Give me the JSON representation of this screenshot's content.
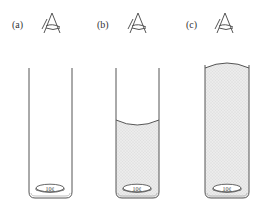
{
  "figure": {
    "panels": [
      {
        "id": "a",
        "label": "(a)",
        "coin_label": "10¢",
        "water": "none"
      },
      {
        "id": "b",
        "label": "(b)",
        "coin_label": "10¢",
        "water": "partial"
      },
      {
        "id": "c",
        "label": "(c)",
        "coin_label": "10¢",
        "water": "full"
      }
    ],
    "colors": {
      "line": "#555555",
      "water_fill": "#e6e6e6"
    }
  }
}
